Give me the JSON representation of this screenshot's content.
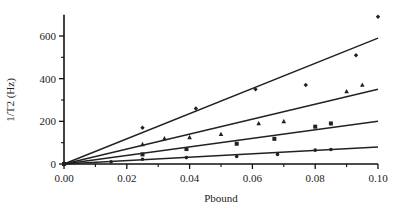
{
  "chart_data": {
    "type": "scatter",
    "title": "",
    "xlabel": "Pbound",
    "ylabel": "1/T2 (Hz)",
    "xlim": [
      0,
      0.1
    ],
    "ylim": [
      0,
      700
    ],
    "xticks": [
      0.0,
      0.02,
      0.04,
      0.06,
      0.08,
      0.1
    ],
    "xtick_labels": [
      "0.00",
      "0.02",
      "0.04",
      "0.06",
      "0.08",
      "0.10"
    ],
    "xminor": [
      0.01,
      0.03,
      0.05,
      0.07,
      0.09
    ],
    "yticks": [
      0,
      200,
      400,
      600
    ],
    "ytick_labels": [
      "0",
      "200",
      "400",
      "600"
    ],
    "yminor": [
      100,
      300,
      500
    ],
    "grid": false,
    "legend": null,
    "series": [
      {
        "name": "series-1",
        "marker": "diamond",
        "fit_slope": 5900,
        "points": [
          [
            0.0,
            0
          ],
          [
            0.025,
            170
          ],
          [
            0.042,
            260
          ],
          [
            0.061,
            350
          ],
          [
            0.077,
            370
          ],
          [
            0.093,
            510
          ],
          [
            0.1,
            690
          ]
        ]
      },
      {
        "name": "series-2",
        "marker": "triangle",
        "fit_slope": 3500,
        "points": [
          [
            0.0,
            0
          ],
          [
            0.025,
            92
          ],
          [
            0.032,
            120
          ],
          [
            0.04,
            125
          ],
          [
            0.05,
            140
          ],
          [
            0.062,
            190
          ],
          [
            0.07,
            200
          ],
          [
            0.09,
            340
          ],
          [
            0.095,
            370
          ]
        ]
      },
      {
        "name": "series-3",
        "marker": "square",
        "fit_slope": 2000,
        "points": [
          [
            0.0,
            0
          ],
          [
            0.025,
            45
          ],
          [
            0.039,
            70
          ],
          [
            0.055,
            95
          ],
          [
            0.067,
            118
          ],
          [
            0.08,
            175
          ],
          [
            0.085,
            190
          ]
        ]
      },
      {
        "name": "series-4",
        "marker": "circle",
        "fit_slope": 800,
        "points": [
          [
            0.0,
            0
          ],
          [
            0.015,
            10
          ],
          [
            0.025,
            22
          ],
          [
            0.039,
            30
          ],
          [
            0.055,
            35
          ],
          [
            0.068,
            45
          ],
          [
            0.08,
            65
          ],
          [
            0.085,
            68
          ]
        ]
      }
    ]
  }
}
